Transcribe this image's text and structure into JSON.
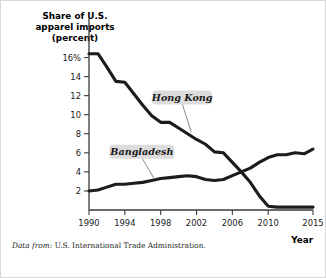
{
  "figure": {
    "source_prefix": "Data from:",
    "source_text": "U.S. International Trade Administration."
  },
  "chart_data": {
    "type": "line",
    "title": "",
    "xlabel": "Year",
    "ylabel_lines": [
      "Share of U.S.",
      "apparel imports",
      "(percent)"
    ],
    "xlim": [
      1990,
      2015
    ],
    "ylim": [
      0,
      17
    ],
    "grid": false,
    "legend": "inline-labels",
    "xticks": [
      1990,
      1994,
      1998,
      2002,
      2006,
      2010,
      2015
    ],
    "xtick_labels": [
      "1990",
      "1994",
      "1998",
      "2002",
      "2006",
      "2010",
      "2015"
    ],
    "yticks": [
      2,
      4,
      6,
      8,
      10,
      12,
      14,
      16
    ],
    "ytick_labels": [
      "2",
      "4",
      "6",
      "8",
      "10",
      "12",
      "14",
      "16%"
    ],
    "x": [
      1990,
      1991,
      1992,
      1993,
      1994,
      1995,
      1996,
      1997,
      1998,
      1999,
      2000,
      2001,
      2002,
      2003,
      2004,
      2005,
      2006,
      2007,
      2008,
      2009,
      2010,
      2011,
      2012,
      2013,
      2014,
      2015
    ],
    "series": [
      {
        "name": "Hong Kong",
        "label": "Hong Kong",
        "color": "#1c1c1c",
        "values": [
          16.4,
          16.4,
          15.0,
          13.5,
          13.4,
          12.2,
          11.0,
          9.9,
          9.2,
          9.2,
          8.6,
          8.0,
          7.4,
          6.9,
          6.1,
          6.0,
          5.0,
          4.0,
          2.9,
          1.5,
          0.4,
          0.3,
          0.3,
          0.3,
          0.3,
          0.3
        ]
      },
      {
        "name": "Bangladesh",
        "label": "Bangladesh",
        "color": "#1c1c1c",
        "values": [
          2.0,
          2.1,
          2.4,
          2.7,
          2.7,
          2.8,
          2.9,
          3.1,
          3.3,
          3.4,
          3.5,
          3.6,
          3.5,
          3.2,
          3.1,
          3.2,
          3.6,
          4.0,
          4.4,
          5.0,
          5.5,
          5.8,
          5.8,
          6.0,
          5.9,
          6.4
        ]
      }
    ],
    "annotations": [
      {
        "name": "Hong Kong",
        "label_x": 2000.4,
        "label_y": 11.8,
        "anchor_x": 2001.4,
        "anchor_y": 8.2
      },
      {
        "name": "Bangladesh",
        "label_x": 1995.9,
        "label_y": 6.1,
        "anchor_x": 1997.3,
        "anchor_y": 3.25
      }
    ]
  }
}
